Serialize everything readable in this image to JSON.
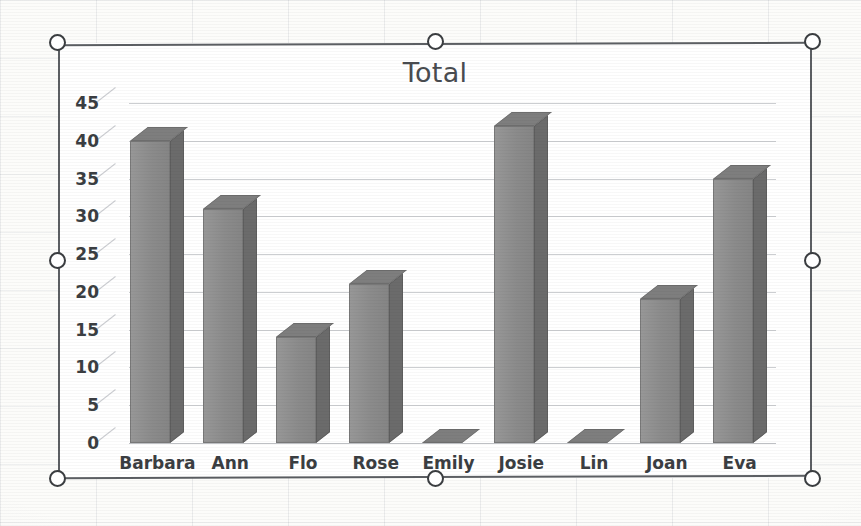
{
  "chart_object": {
    "selected": true,
    "handle_names": [
      "top-left",
      "top-center",
      "top-right",
      "middle-left",
      "middle-right",
      "bottom-left",
      "bottom-center",
      "bottom-right"
    ]
  },
  "colors": {
    "bar_front": "#8e8e8e",
    "bar_side": "#6b6b6b",
    "bar_top": "#7e7e7e",
    "gridline": "#7a7f89",
    "text": "#3b3e42",
    "title": "#494c50",
    "selection_border": "#5c5f63",
    "page_background": "#fcfcfa"
  },
  "chart_data": {
    "type": "bar",
    "title": "Total",
    "xlabel": "",
    "ylabel": "",
    "categories": [
      "Barbara",
      "Ann",
      "Flo",
      "Rose",
      "Emily",
      "Josie",
      "Lin",
      "Joan",
      "Eva"
    ],
    "values": [
      40,
      31,
      14,
      21,
      0,
      42,
      0,
      19,
      35
    ],
    "yticks": [
      0,
      5,
      10,
      15,
      20,
      25,
      30,
      35,
      40,
      45
    ],
    "ylim": [
      0,
      45
    ],
    "grid": true,
    "legend": false,
    "legend_position": "none",
    "style_3d": true,
    "series": [
      {
        "name": "Total",
        "values": [
          40,
          31,
          14,
          21,
          0,
          42,
          0,
          19,
          35
        ]
      }
    ]
  }
}
